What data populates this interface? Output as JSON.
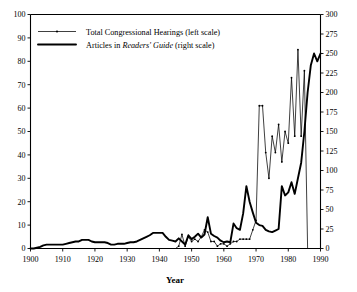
{
  "chart_data": {
    "type": "line",
    "title": "",
    "subtitle": "",
    "xlabel": "Year",
    "ylabel": "",
    "ylabel_right": "",
    "xlim": [
      1900,
      1990
    ],
    "ylim": [
      0,
      100
    ],
    "ylim_right": [
      0,
      300
    ],
    "grid": false,
    "legend_position": "top-left",
    "xticks": [
      1900,
      1910,
      1920,
      1930,
      1940,
      1950,
      1960,
      1970,
      1980,
      1990
    ],
    "xtick_labels": [
      "1900",
      "1910",
      "1920",
      "1930",
      "1940",
      "1950",
      "1960",
      "1970",
      "1980",
      "1990"
    ],
    "yticks": [
      0,
      10,
      20,
      30,
      40,
      50,
      60,
      70,
      80,
      90,
      100
    ],
    "ytick_labels": [
      "0",
      "10",
      "20",
      "30",
      "40",
      "50",
      "60",
      "70",
      "80",
      "90",
      "100"
    ],
    "yticks_right": [
      0,
      25,
      50,
      75,
      100,
      125,
      150,
      175,
      200,
      225,
      250,
      275,
      300
    ],
    "ytick_labels_right": [
      "0",
      "25",
      "50",
      "75",
      "100",
      "125",
      "150",
      "175",
      "200",
      "225",
      "250",
      "275",
      "300"
    ],
    "series": [
      {
        "name": "Total Congressional Hearings (left scale)",
        "axis": "left",
        "style": "thin-with-dots",
        "x": [
          1900,
          1901,
          1902,
          1903,
          1904,
          1905,
          1906,
          1907,
          1908,
          1909,
          1910,
          1911,
          1912,
          1913,
          1914,
          1915,
          1916,
          1917,
          1918,
          1919,
          1920,
          1921,
          1922,
          1923,
          1924,
          1925,
          1926,
          1927,
          1928,
          1929,
          1930,
          1931,
          1932,
          1933,
          1934,
          1935,
          1936,
          1937,
          1938,
          1939,
          1940,
          1941,
          1942,
          1943,
          1944,
          1945,
          1946,
          1947,
          1948,
          1949,
          1950,
          1951,
          1952,
          1953,
          1954,
          1955,
          1956,
          1957,
          1958,
          1959,
          1960,
          1961,
          1962,
          1963,
          1964,
          1965,
          1966,
          1967,
          1968,
          1969,
          1970,
          1971,
          1972,
          1973,
          1974,
          1975,
          1976,
          1977,
          1978,
          1979,
          1980,
          1981,
          1982,
          1983,
          1984,
          1985,
          1986,
          1987,
          1988,
          1989,
          1990
        ],
        "values": [
          0,
          0,
          0,
          0,
          0,
          0,
          0,
          0,
          0,
          0,
          0,
          0,
          0,
          0,
          0,
          0,
          0,
          0,
          0,
          0,
          0,
          0,
          0,
          0,
          0,
          0,
          0,
          0,
          0,
          0,
          0,
          0,
          0,
          0,
          0,
          0,
          0,
          0,
          0,
          0,
          0,
          0,
          0,
          0,
          0,
          0,
          1,
          6,
          1,
          5,
          3,
          4,
          3,
          5,
          8,
          7,
          3,
          3,
          1,
          2,
          2,
          1,
          2,
          3,
          3,
          4,
          4,
          4,
          4,
          8,
          12,
          61,
          61,
          41,
          30,
          48,
          41,
          53,
          37,
          50,
          45,
          73,
          48,
          85,
          48,
          76,
          0,
          0,
          0,
          0,
          0
        ]
      },
      {
        "name": "Articles in Readers' Guide (right scale)",
        "axis": "right",
        "style": "thick",
        "x": [
          1900,
          1901,
          1902,
          1903,
          1904,
          1905,
          1906,
          1907,
          1908,
          1909,
          1910,
          1911,
          1912,
          1913,
          1914,
          1915,
          1916,
          1917,
          1918,
          1919,
          1920,
          1921,
          1922,
          1923,
          1924,
          1925,
          1926,
          1927,
          1928,
          1929,
          1930,
          1931,
          1932,
          1933,
          1934,
          1935,
          1936,
          1937,
          1938,
          1939,
          1940,
          1941,
          1942,
          1943,
          1944,
          1945,
          1946,
          1947,
          1948,
          1949,
          1950,
          1951,
          1952,
          1953,
          1954,
          1955,
          1956,
          1957,
          1958,
          1959,
          1960,
          1961,
          1962,
          1963,
          1964,
          1965,
          1966,
          1967,
          1968,
          1969,
          1970,
          1971,
          1972,
          1973,
          1974,
          1975,
          1976,
          1977,
          1978,
          1979,
          1980,
          1981,
          1982,
          1983,
          1984,
          1985,
          1986,
          1987,
          1988,
          1989,
          1990
        ],
        "values": [
          0,
          0,
          1,
          2,
          4,
          5,
          5,
          5,
          5,
          5,
          5,
          6,
          7,
          8,
          9,
          9,
          11,
          11,
          11,
          9,
          8,
          8,
          8,
          8,
          7,
          5,
          5,
          6,
          6,
          6,
          7,
          8,
          8,
          9,
          11,
          13,
          15,
          17,
          20,
          20,
          20,
          20,
          15,
          11,
          10,
          9,
          13,
          9,
          5,
          17,
          12,
          15,
          19,
          14,
          18,
          40,
          19,
          16,
          14,
          10,
          8,
          9,
          8,
          32,
          26,
          24,
          45,
          80,
          60,
          46,
          33,
          30,
          29,
          24,
          22,
          21,
          23,
          25,
          80,
          68,
          72,
          85,
          70,
          90,
          110,
          150,
          200,
          235,
          250,
          240,
          250
        ]
      }
    ],
    "legend": [
      {
        "label_prefix": "Total Congressional Hearings",
        "label_italic": "",
        "label_suffix": " (left scale)",
        "style": "thin-with-dots"
      },
      {
        "label_prefix": "Articles in ",
        "label_italic": "Readers' Guide",
        "label_suffix": " (right scale)",
        "style": "thick"
      }
    ],
    "colors": {
      "line": "#000000",
      "axis": "#000000",
      "background": "#ffffff"
    }
  }
}
